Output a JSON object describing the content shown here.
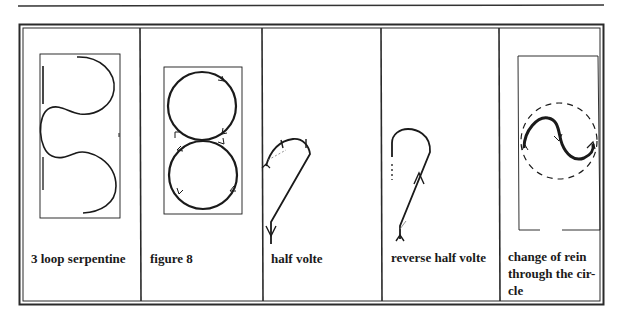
{
  "figures": [
    {
      "id": "three-loop-serpentine",
      "label": "3 loop serpentine"
    },
    {
      "id": "figure-8",
      "label": "figure 8"
    },
    {
      "id": "half-volte",
      "label": "half volte"
    },
    {
      "id": "reverse-half-volte",
      "label": "reverse half volte"
    },
    {
      "id": "change-of-rein-through-circle",
      "label_lines": [
        "change of rein",
        "through the cir-",
        "cle"
      ]
    }
  ],
  "colors": {
    "line": "#1a1a1a",
    "border": "#2a2a2a",
    "background": "#ffffff"
  }
}
